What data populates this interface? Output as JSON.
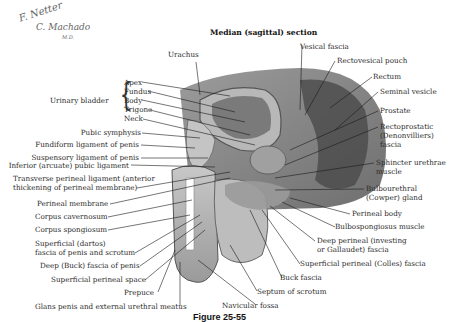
{
  "signature": {
    "line1": "F. Netter",
    "line2": "C. Machado",
    "suffix": "M.D."
  },
  "title": "Median (sagittal) section",
  "figure_caption": "Figure 25-55",
  "urinary_bladder": {
    "group_label": "Urinary bladder",
    "parts": [
      "Apex",
      "Fundus",
      "Body",
      "Trigone",
      "Neck"
    ]
  },
  "labels_top": {
    "urachus": "Urachus",
    "vesical_fascia": "Vesical fascia",
    "rectovesical_pouch": "Rectovesical pouch"
  },
  "labels_left": [
    "Pubic symphysis",
    "Fundiform ligament of penis",
    "Suspensory ligament of penis",
    "Inferior (arcuate) pubic ligament",
    "Transverse perineal ligament (anterior",
    "thickening of perineal membrane)",
    "Perineal membrane",
    "Corpus cavernosum",
    "Corpus spongiosum",
    "Superficial (dartos)",
    "fascia of penis and scrotum",
    "Deep (Buck) fascia of penis",
    "Superficial perineal space",
    "Prepuce",
    "Glans penis and external urethral meatus"
  ],
  "labels_right": [
    "Rectum",
    "Seminal vesicle",
    "Prostate",
    "Rectoprostatic",
    "(Denonvilliers)",
    "fascia",
    "Sphincter urethrae",
    "muscle",
    "Bulbourethral",
    "(Cowper) gland",
    "Perineal body",
    "Bulbospongiosus muscle",
    "Deep perineal (investing",
    "or Gallaudet) fascia",
    "Superficial perineal (Colles) fascia",
    "Buck fascia",
    "Septum of scrotum",
    "Navicular fossa"
  ],
  "colors": {
    "tissue_dark": "#6e6e6e",
    "tissue_mid": "#a3a3a3",
    "tissue_light": "#d0d0d0",
    "line": "#1a1a1a"
  }
}
